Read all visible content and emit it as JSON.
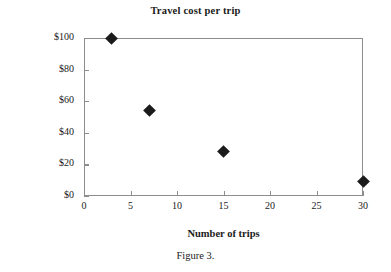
{
  "figure": {
    "caption": "Figure 3."
  },
  "chart_data": {
    "type": "scatter",
    "title": "Travel cost per trip",
    "xlabel": "Number of trips",
    "ylabel": "Dollars per trip",
    "x": [
      3,
      7,
      15,
      30
    ],
    "values": [
      100,
      54,
      28,
      9
    ],
    "points": [
      {
        "x": 3,
        "y": 100
      },
      {
        "x": 7,
        "y": 54
      },
      {
        "x": 15,
        "y": 28
      },
      {
        "x": 30,
        "y": 9
      }
    ],
    "xlim": [
      0,
      30
    ],
    "ylim": [
      0,
      100
    ],
    "xticks": [
      0,
      5,
      10,
      15,
      20,
      25,
      30
    ],
    "yticks": [
      0,
      20,
      40,
      60,
      80,
      100
    ],
    "xtick_labels": [
      "0",
      "5",
      "10",
      "15",
      "20",
      "25",
      "30"
    ],
    "ytick_labels": [
      "$0",
      "$20",
      "$40",
      "$60",
      "$80",
      "$100"
    ],
    "grid": false,
    "legend": null,
    "marker": "diamond",
    "marker_color": "#1b1b1b",
    "axis_color": "#8d8d8d",
    "background": "#ffffff"
  }
}
